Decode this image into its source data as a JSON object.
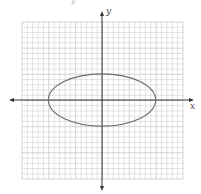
{
  "chart_data": {
    "type": "line",
    "title": "",
    "xlabel": "x",
    "ylabel": "y",
    "grid": true,
    "xlim": [
      -15,
      15
    ],
    "ylim": [
      -15,
      15
    ],
    "grid_step": 1,
    "legend": null,
    "series": [
      {
        "name": "ellipse",
        "equation": "x^2/100 + y^2/25 = 1",
        "center": [
          0,
          0
        ],
        "semi_major_x": 10,
        "semi_minor_y": 5,
        "vertices": [
          [
            -10,
            0
          ],
          [
            10,
            0
          ],
          [
            0,
            5
          ],
          [
            0,
            -5
          ]
        ]
      }
    ]
  },
  "labels": {
    "x_axis": "x",
    "y_axis": "y",
    "top_fragment": "y"
  },
  "colors": {
    "grid": "#c8c8c8",
    "axis": "#333333",
    "curve": "#6a6a6a",
    "background": "#ffffff"
  },
  "layout": {
    "grid_left": 22,
    "grid_top": 22,
    "grid_right": 183,
    "grid_bottom": 179,
    "origin_x": 102,
    "origin_y": 100,
    "x_axis_left_tip": 9,
    "x_axis_right_tip": 194,
    "y_axis_top_tip": 11,
    "y_axis_bottom_tip": 191
  }
}
